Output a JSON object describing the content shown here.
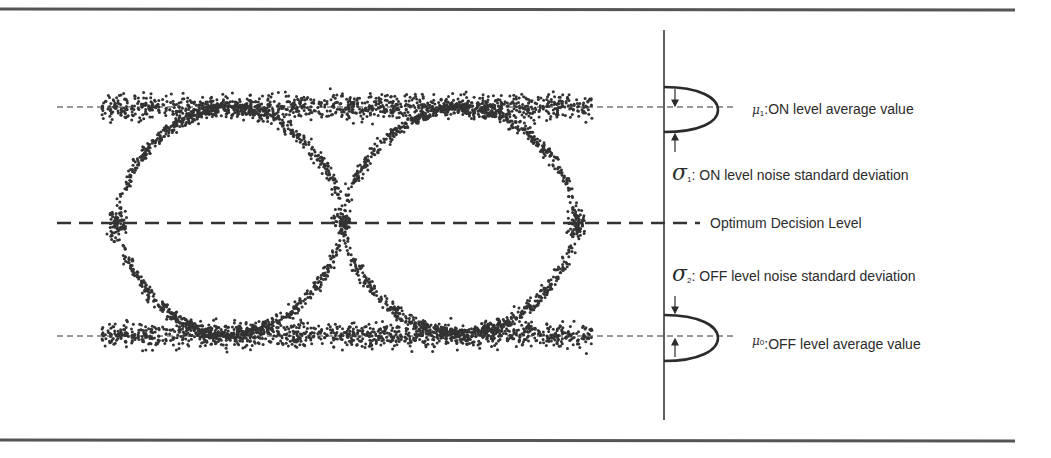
{
  "figure": {
    "type": "eye-diagram",
    "colors": {
      "ink": "#2b2b2b",
      "rule": "#555555",
      "background": "#ffffff"
    }
  },
  "geometry": {
    "width": 1051,
    "height": 458,
    "top_rule": {
      "x1": 0,
      "x2": 1015,
      "y1": 6,
      "y2": 12
    },
    "bottom_rule": {
      "x1": 0,
      "x2": 1015,
      "y1": 436,
      "y2": 444
    },
    "axis": {
      "x": 664,
      "y1": 30,
      "y2": 420
    },
    "eye": {
      "x_start": 102,
      "x_end": 592,
      "crossings_x": [
        117,
        343,
        577
      ],
      "on_level_y": 107,
      "off_level_y": 335,
      "band_half_height": 22,
      "decision_y": 223,
      "dot_seed": 7
    },
    "on_mean_line": {
      "x1": 57,
      "x2": 735,
      "y": 110
    },
    "off_mean_line": {
      "x1": 57,
      "x2": 735,
      "y": 336
    },
    "decision_line": {
      "x1": 57,
      "x2": 700,
      "y": 223
    },
    "gauss_on": {
      "top": 87,
      "bottom": 132,
      "apex_x": 718,
      "mid_y": 110
    },
    "gauss_off": {
      "top": 315,
      "bottom": 361,
      "apex_x": 718,
      "mid_y": 338
    }
  },
  "labels": {
    "mu1_symbol": "μ",
    "mu1_sub": "1",
    "mu1_text": ":ON level average value",
    "sigma1_symbol": "σ",
    "sigma1_sub": "1",
    "sigma1_text": ": ON level noise standard deviation",
    "decision_text": "Optimum Decision Level",
    "sigma2_symbol": "σ",
    "sigma2_sub": "2",
    "sigma2_text": ": OFF level noise standard deviation",
    "mu0_symbol": "μ",
    "mu0_sub": "0",
    "mu0_text": ":OFF level average value"
  }
}
